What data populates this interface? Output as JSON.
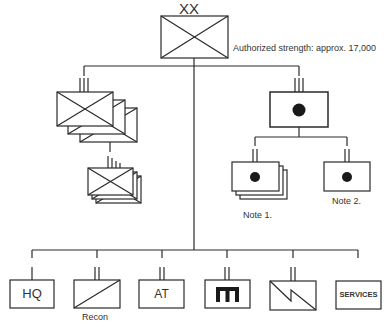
{
  "diagram": {
    "type": "military-organization-chart",
    "division": {
      "echelon_marker": "XX",
      "symbol": "infantry",
      "annotation": "Authorized strength: approx. 17,000"
    },
    "subordinates": {
      "left_brigades": {
        "echelon_marker": "III",
        "symbol": "infantry",
        "stacked": 3
      },
      "left_battalions": {
        "echelon_marker": "IIII",
        "symbol": "infantry",
        "stacked": 3
      },
      "right_regiment": {
        "echelon_marker": "III",
        "symbol": "artillery"
      },
      "artillery_battalions_note1": {
        "echelon_marker": "II",
        "symbol": "artillery",
        "stacked": 3,
        "label": "Note 1."
      },
      "artillery_battalion_note2": {
        "echelon_marker": "II",
        "symbol": "artillery",
        "label": "Note 2."
      }
    },
    "support_units": [
      {
        "id": "hq",
        "echelon_marker": "I",
        "text": "HQ",
        "label": ""
      },
      {
        "id": "recon",
        "echelon_marker": "II",
        "symbol": "cavalry",
        "text": "",
        "label": "Recon"
      },
      {
        "id": "at",
        "echelon_marker": "II",
        "text": "AT",
        "label": ""
      },
      {
        "id": "engineer",
        "echelon_marker": "II",
        "symbol": "engineer",
        "text": "",
        "label": ""
      },
      {
        "id": "signal",
        "echelon_marker": "II",
        "symbol": "signal",
        "text": "",
        "label": ""
      },
      {
        "id": "services",
        "echelon_marker": "",
        "text": "SERVICES",
        "label": ""
      }
    ]
  }
}
